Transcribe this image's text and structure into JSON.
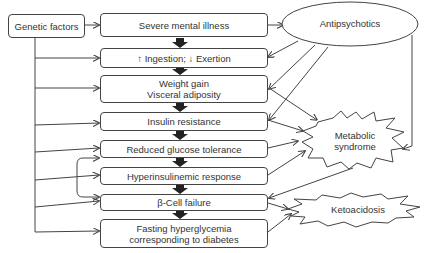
{
  "diagram": {
    "genetic_factors": "Genetic factors",
    "chain": [
      {
        "id": "severe",
        "lines": [
          "Severe mental illness"
        ]
      },
      {
        "id": "ingestion",
        "lines": [
          "↑ Ingestion; ↓ Exertion"
        ]
      },
      {
        "id": "weight",
        "lines": [
          "Weight gain",
          "Visceral adiposity"
        ]
      },
      {
        "id": "insulin",
        "lines": [
          "Insulin resistance"
        ]
      },
      {
        "id": "glucose",
        "lines": [
          "Reduced glucose tolerance"
        ]
      },
      {
        "id": "hyper",
        "lines": [
          "Hyperinsulinemic response"
        ]
      },
      {
        "id": "beta",
        "lines": [
          "β-Cell failure"
        ]
      },
      {
        "id": "fasting",
        "lines": [
          "Fasting hyperglycemia",
          "corresponding to diabetes"
        ]
      }
    ],
    "antipsychotics": "Antipsychotics",
    "metabolic_syndrome": [
      "Metabolic",
      "syndrome"
    ],
    "ketoacidosis": "Ketoacidosis"
  }
}
